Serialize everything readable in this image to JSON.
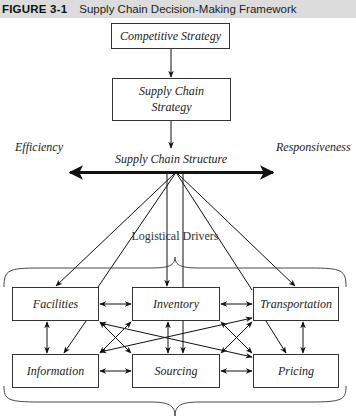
{
  "header": {
    "figure_label": "FIGURE 3-1",
    "title": "Supply Chain Decision-Making Framework"
  },
  "diagram": {
    "competitive_strategy": "Competitive Strategy",
    "supply_chain_strategy_line1": "Supply Chain",
    "supply_chain_strategy_line2": "Strategy",
    "supply_chain_structure": "Supply Chain Structure",
    "efficiency": "Efficiency",
    "responsiveness": "Responsiveness",
    "logistical_drivers": "Logistical Drivers",
    "drivers": {
      "facilities": "Facilities",
      "inventory": "Inventory",
      "transportation": "Transportation",
      "information": "Information",
      "sourcing": "Sourcing",
      "pricing": "Pricing"
    }
  }
}
